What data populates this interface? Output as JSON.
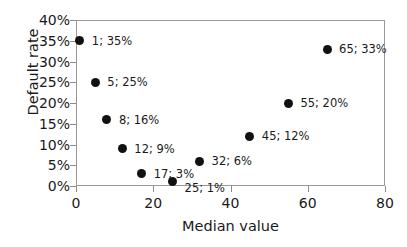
{
  "chart_data": {
    "type": "scatter",
    "title": "",
    "xlabel": "Median value",
    "ylabel": "Default rate",
    "xlim": [
      0,
      80
    ],
    "ylim": [
      0,
      40
    ],
    "xticks": [
      "0",
      "20",
      "40",
      "60",
      "80"
    ],
    "yticks": [
      "0%",
      "5%",
      "10%",
      "15%",
      "20%",
      "25%",
      "30%",
      "35%",
      "40%"
    ],
    "grid": false,
    "legend": "none",
    "marker_color": "#111111",
    "frame_color": "#999999",
    "points": [
      {
        "x": 1,
        "y": 35,
        "label": "1; 35%",
        "label_dx": 12,
        "label_dy": 0
      },
      {
        "x": 5,
        "y": 25,
        "label": "5; 25%",
        "label_dx": 12,
        "label_dy": 0
      },
      {
        "x": 8,
        "y": 16,
        "label": "8; 16%",
        "label_dx": 12,
        "label_dy": 0
      },
      {
        "x": 12,
        "y": 9,
        "label": "12; 9%",
        "label_dx": 12,
        "label_dy": 0
      },
      {
        "x": 17,
        "y": 3,
        "label": "17; 3%",
        "label_dx": 12,
        "label_dy": 0
      },
      {
        "x": 25,
        "y": 1,
        "label": "25; 1%",
        "label_dx": 12,
        "label_dy": 6
      },
      {
        "x": 32,
        "y": 6,
        "label": "32; 6%",
        "label_dx": 12,
        "label_dy": 0
      },
      {
        "x": 45,
        "y": 12,
        "label": "45; 12%",
        "label_dx": 12,
        "label_dy": 0
      },
      {
        "x": 55,
        "y": 20,
        "label": "55; 20%",
        "label_dx": 12,
        "label_dy": 0
      },
      {
        "x": 65,
        "y": 33,
        "label": "65; 33%",
        "label_dx": 12,
        "label_dy": 0
      }
    ]
  }
}
